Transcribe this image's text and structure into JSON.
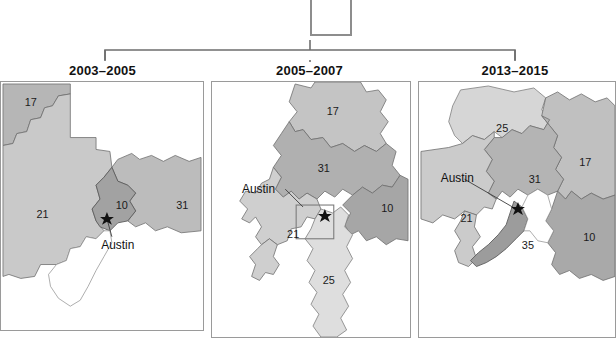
{
  "figure": {
    "type": "map-panel-series",
    "callout_box": {
      "name": "inset-callout-box",
      "visible": true,
      "cropped_top": true
    },
    "bracket": {
      "visible": true,
      "left_x": 105,
      "right_x": 515,
      "tick_x": 310
    }
  },
  "panels": [
    {
      "title": "2003–2005",
      "city_label": "Austin",
      "districts": [
        {
          "number": "17",
          "x": 30,
          "y": 24,
          "shade": "#b6b6b6"
        },
        {
          "number": "21",
          "x": 42,
          "y": 137,
          "shade": "#c9c9c9"
        },
        {
          "number": "10",
          "x": 122,
          "y": 128,
          "shade": "#a2a2a2"
        },
        {
          "number": "31",
          "x": 183,
          "y": 128,
          "shade": "#bcbcbc"
        }
      ],
      "city_label_pos": {
        "x": 118,
        "y": 165
      },
      "star_pos": {
        "x": 107,
        "y": 136
      }
    },
    {
      "title": "2005–2007",
      "city_label": "Austin",
      "districts": [
        {
          "number": "17",
          "x": 122,
          "y": 33,
          "shade": "#c4c4c4"
        },
        {
          "number": "31",
          "x": 113,
          "y": 91,
          "shade": "#b0b0b0"
        },
        {
          "number": "10",
          "x": 177,
          "y": 131,
          "shade": "#a6a6a6"
        },
        {
          "number": "21",
          "x": 82,
          "y": 157,
          "shade": "#cfcfcf"
        },
        {
          "number": "25",
          "x": 118,
          "y": 204,
          "shade": "#dedede"
        }
      ],
      "city_label_pos": {
        "x": 47,
        "y": 112
      },
      "star_pos": {
        "x": 114,
        "y": 133
      },
      "inset_rect": {
        "x": 85,
        "y": 124,
        "w": 38,
        "h": 34
      }
    },
    {
      "title": "2013–2015",
      "city_label": "Austin",
      "districts": [
        {
          "number": "25",
          "x": 84,
          "y": 50,
          "shade": "#d6d6d6"
        },
        {
          "number": "17",
          "x": 168,
          "y": 85,
          "shade": "#c0c0c0"
        },
        {
          "number": "31",
          "x": 117,
          "y": 102,
          "shade": "#b4b4b4"
        },
        {
          "number": "10",
          "x": 172,
          "y": 160,
          "shade": "#a9a9a9"
        },
        {
          "number": "21",
          "x": 48,
          "y": 141,
          "shade": "#cbcbcb"
        },
        {
          "number": "35",
          "x": 110,
          "y": 164,
          "shade": "#9c9c9c"
        }
      ],
      "city_label_pos": {
        "x": 22,
        "y": 101
      },
      "star_pos": {
        "x": 100,
        "y": 126
      }
    }
  ],
  "colors": {
    "panel_border": "#9a9a9a",
    "bracket_line": "#6e6e6e",
    "callout_border": "#8d8d8d",
    "label_text": "#1a1a1a",
    "background": "#ffffff"
  }
}
